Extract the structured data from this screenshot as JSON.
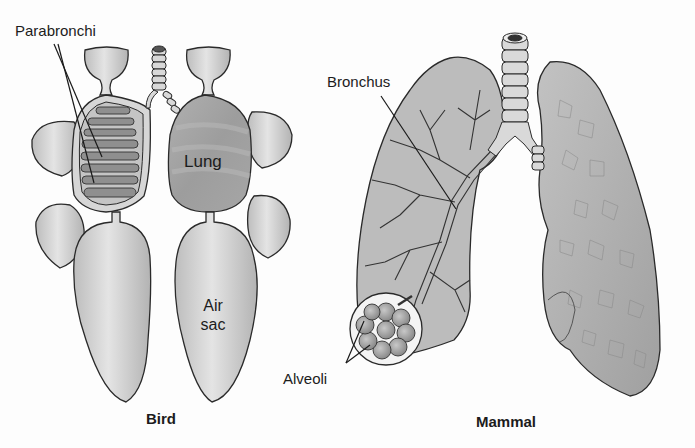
{
  "diagram": {
    "panels": [
      {
        "id": "bird",
        "caption": "Bird",
        "labels": {
          "parabronchi": "Parabronchi",
          "lung": "Lung",
          "air_sac_line1": "Air",
          "air_sac_line2": "sac"
        }
      },
      {
        "id": "mammal",
        "caption": "Mammal",
        "labels": {
          "bronchus": "Bronchus",
          "alveoli": "Alveoli"
        }
      }
    ],
    "colors": {
      "organ_fill": "#cfcfcf",
      "lung_fill": "#a9a9a9",
      "outline": "#2a2a2a",
      "text": "#1c1c1c",
      "background": "#fdfdfd"
    }
  }
}
